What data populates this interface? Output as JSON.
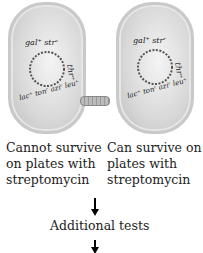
{
  "cells": [
    {
      "id": "left",
      "genes": [
        "gal+",
        "str^s",
        "thr+",
        "leu+",
        "azi^r",
        "ton^r",
        "lac+"
      ],
      "label_top": "gal⁺ strˢ",
      "label_right": "thr⁺",
      "label_bottom": "lac⁺ tonʳ aziʳ leu⁺",
      "has_conjugation_pilus": true,
      "caption": [
        "Cannot survive",
        "on plates with",
        "streptomycin"
      ]
    },
    {
      "id": "right",
      "genes": [
        "gal+",
        "str^r",
        "thr+",
        "leu+",
        "azi^r",
        "ton^r",
        "lac+"
      ],
      "label_top": "gal⁺ strʳ",
      "label_right": "thr⁺",
      "label_bottom": "lac⁺ tonʳ aziʳ leu⁺",
      "has_conjugation_pilus": false,
      "caption": [
        "Can survive on",
        "plates with",
        "streptomycin"
      ]
    }
  ],
  "flow": {
    "step_label": "Additional tests"
  }
}
